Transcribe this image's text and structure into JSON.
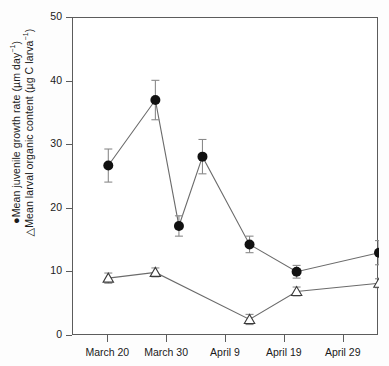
{
  "chart_data": {
    "type": "line",
    "title": "",
    "xlabel": "",
    "ylabel_line1": "Mean juvenile growth rate (µm day",
    "ylabel_line2": "Mean larval organic content (µg C larva",
    "ylabel_sup": "−1",
    "ylabel_sym1": "●",
    "ylabel_sym2": "△",
    "ylim": [
      0,
      50
    ],
    "yticks": [
      0,
      10,
      20,
      30,
      40,
      50
    ],
    "ytick_labels": [
      "0",
      "10",
      "20",
      "30",
      "40",
      "50"
    ],
    "xlim_days": [
      14,
      66
    ],
    "xticks_days": [
      20,
      30,
      40,
      50,
      60
    ],
    "xtick_labels": [
      "March 20",
      "March 30",
      "April 9",
      "April 19",
      "April 29"
    ],
    "grid": false,
    "legend": "none",
    "series": [
      {
        "name": "Mean juvenile growth rate",
        "marker": "filled-circle",
        "color": "#111111",
        "x_days": [
          20,
          28,
          32,
          36,
          44,
          52,
          66
        ],
        "x_labels": [
          "March 20",
          "March 28",
          "April 1",
          "April 5",
          "April 13",
          "April 21",
          "May 5"
        ],
        "values": [
          26.8,
          37.1,
          17.3,
          28.2,
          14.4,
          10.1,
          13.1
        ],
        "err_low": [
          2.6,
          3.1,
          1.6,
          2.7,
          1.3,
          1.0,
          1.9
        ],
        "err_high": [
          2.6,
          3.1,
          1.6,
          2.7,
          1.3,
          1.0,
          1.9
        ]
      },
      {
        "name": "Mean larval organic content",
        "marker": "open-triangle",
        "color": "#3a3a3a",
        "x_days": [
          20,
          28,
          44,
          52,
          66
        ],
        "x_labels": [
          "March 20",
          "March 28",
          "April 13",
          "April 21",
          "May 5"
        ],
        "values": [
          9.1,
          10.0,
          2.6,
          7.0,
          8.3
        ],
        "err_low": [
          0.8,
          0.7,
          0.8,
          0.7,
          0.7
        ],
        "err_high": [
          0.8,
          0.7,
          0.8,
          0.7,
          0.7
        ]
      }
    ]
  }
}
